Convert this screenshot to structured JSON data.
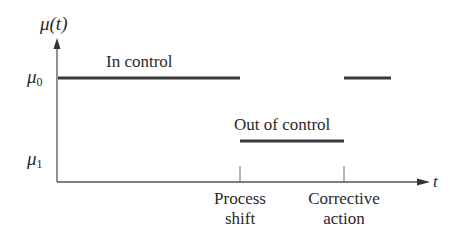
{
  "diagram": {
    "y_axis_label": "μ(t)",
    "x_axis_label": "t",
    "levels": {
      "mu0": {
        "symbol": "μ",
        "subscript": "0"
      },
      "mu1": {
        "symbol": "μ",
        "subscript": "1"
      }
    },
    "segments": [
      {
        "state": "In control",
        "level": "mu0",
        "from": "start",
        "to": "Process shift"
      },
      {
        "state": "Out of control",
        "level": "mu1",
        "from": "Process shift",
        "to": "Corrective action"
      },
      {
        "state": "In control",
        "level": "mu0",
        "from": "Corrective action",
        "to": "end"
      }
    ],
    "annotations": {
      "in_control": "In control",
      "out_of_control": "Out of control"
    },
    "events": {
      "process_shift": {
        "line1": "Process",
        "line2": "shift"
      },
      "corrective_action": {
        "line1": "Corrective",
        "line2": "action"
      }
    },
    "colors": {
      "line": "#3a3a3a",
      "axis": "#555555",
      "text": "#2a2a2a"
    }
  }
}
